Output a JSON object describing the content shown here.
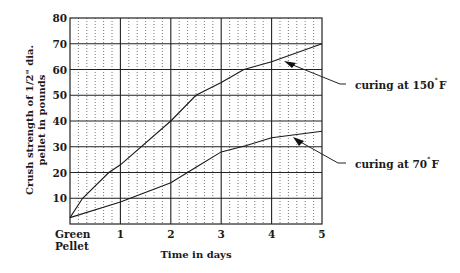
{
  "chart_data": {
    "type": "line",
    "title": "",
    "xlabel": "Time in days",
    "ylabel_line1": "Crush strength of 1/2\" dia.",
    "ylabel_line2": "pellet in pounds",
    "x_tick_labels": [
      "Green Pellet",
      "1",
      "2",
      "3",
      "4",
      "5"
    ],
    "x_tick_label_green_line1": "Green",
    "x_tick_label_green_line2": "Pellet",
    "x_ticks": [
      0,
      1,
      2,
      3,
      4,
      5
    ],
    "y_ticks": [
      10,
      20,
      30,
      40,
      50,
      60,
      70,
      80
    ],
    "xlim": [
      0,
      5
    ],
    "ylim": [
      0,
      80
    ],
    "grid": {
      "major": true,
      "minor_x_subdivisions": 6,
      "minor_style": "dotted"
    },
    "legend": "none (inline annotations with arrows, right side)",
    "series": [
      {
        "name": "curing at 150°F",
        "label_text": "curing at 150",
        "label_unit": "F",
        "x": [
          0,
          0.25,
          0.77,
          1,
          2,
          2.5,
          3,
          3.45,
          4,
          5
        ],
        "values": [
          2.5,
          10,
          20,
          23,
          40,
          50,
          55,
          60,
          63,
          70
        ]
      },
      {
        "name": "curing at 70°F",
        "label_text": "curing at 70",
        "label_unit": "F",
        "x": [
          0,
          1,
          2,
          2.5,
          3,
          3.5,
          4,
          5
        ],
        "values": [
          2.5,
          8.5,
          16,
          22,
          28,
          30.5,
          33.5,
          36
        ]
      }
    ],
    "annotations": [
      {
        "text": "curing at 150°F",
        "points_to": {
          "x": 4.25,
          "y": 63.5
        }
      },
      {
        "text": "curing at 70°F",
        "points_to": {
          "x": 4.45,
          "y": 34.5
        }
      }
    ]
  },
  "degree_symbol": "°"
}
